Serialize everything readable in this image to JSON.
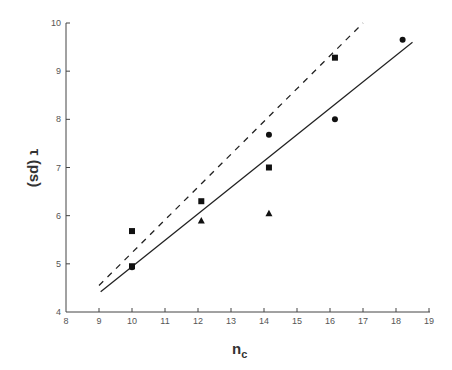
{
  "chart_data": {
    "type": "scatter",
    "title": "",
    "xlabel": "n_c",
    "ylabel": "τ (ps)",
    "xlim": [
      8,
      19
    ],
    "ylim": [
      4,
      10
    ],
    "x_ticks": [
      8,
      9,
      10,
      11,
      12,
      13,
      14,
      15,
      16,
      17,
      18,
      19
    ],
    "y_ticks": [
      4,
      5,
      6,
      7,
      8,
      9,
      10
    ],
    "grid": false,
    "legend": null,
    "series": [
      {
        "name": "squares",
        "marker": "square",
        "points": [
          [
            10.0,
            5.68
          ],
          [
            10.0,
            4.95
          ],
          [
            12.1,
            6.3
          ],
          [
            14.15,
            7.0
          ],
          [
            16.15,
            9.28
          ]
        ]
      },
      {
        "name": "circles",
        "marker": "circle",
        "points": [
          [
            10.0,
            4.93
          ],
          [
            14.15,
            7.68
          ],
          [
            16.15,
            8.0
          ],
          [
            18.2,
            9.65
          ]
        ]
      },
      {
        "name": "triangles",
        "marker": "triangle",
        "points": [
          [
            12.1,
            5.9
          ],
          [
            14.15,
            6.05
          ]
        ]
      }
    ],
    "lines": [
      {
        "name": "dashed-fit",
        "style": "dashed",
        "x": [
          9.0,
          17.0
        ],
        "y": [
          4.55,
          10.0
        ]
      },
      {
        "name": "solid-fit",
        "style": "solid",
        "x": [
          9.05,
          18.5
        ],
        "y": [
          4.42,
          9.6
        ]
      }
    ]
  },
  "axes": {
    "x_title_main": "n",
    "x_title_sub": "c",
    "y_title": "τ (ps)"
  }
}
